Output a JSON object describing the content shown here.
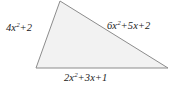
{
  "figure": {
    "type": "triangle-diagram",
    "background_color": "#ffffff",
    "fill_color": "#f2f2f2",
    "stroke_color": "#8c8c8c",
    "text_color": "#1a1a1a",
    "vertices": {
      "apex": [
        60,
        1
      ],
      "bottom_left": [
        36,
        68
      ],
      "bottom_right": [
        168,
        68
      ]
    },
    "sides": [
      {
        "position": "left",
        "label": "4x^2 + 2",
        "terms": [
          {
            "coefficient": "4",
            "variable": "x",
            "exponent": "2"
          },
          {
            "operator": "+",
            "coefficient": "2",
            "variable": "",
            "exponent": ""
          }
        ]
      },
      {
        "position": "right",
        "label": "6x^2 + 5x + 2",
        "terms": [
          {
            "coefficient": "6",
            "variable": "x",
            "exponent": "2"
          },
          {
            "operator": "+",
            "coefficient": "5",
            "variable": "x",
            "exponent": ""
          },
          {
            "operator": "+",
            "coefficient": "2",
            "variable": "",
            "exponent": ""
          }
        ]
      },
      {
        "position": "bottom",
        "label": "2x^2 + 3x + 1",
        "terms": [
          {
            "coefficient": "2",
            "variable": "x",
            "exponent": "2"
          },
          {
            "operator": "+",
            "coefficient": "3",
            "variable": "x",
            "exponent": ""
          },
          {
            "operator": "+",
            "coefficient": "1",
            "variable": "",
            "exponent": ""
          }
        ]
      }
    ]
  },
  "labels": {
    "left": {
      "c1": "4",
      "v1": "x",
      "e1": "2",
      "o2": "+",
      "c2": "2"
    },
    "right": {
      "c1": "6",
      "v1": "x",
      "e1": "2",
      "o2": "+",
      "c2": "5",
      "v2": "x",
      "o3": "+",
      "c3": "2"
    },
    "bottom": {
      "c1": "2",
      "v1": "x",
      "e1": "2",
      "o2": "+",
      "c2": "3",
      "v2": "x",
      "o3": "+",
      "c3": "1"
    }
  }
}
